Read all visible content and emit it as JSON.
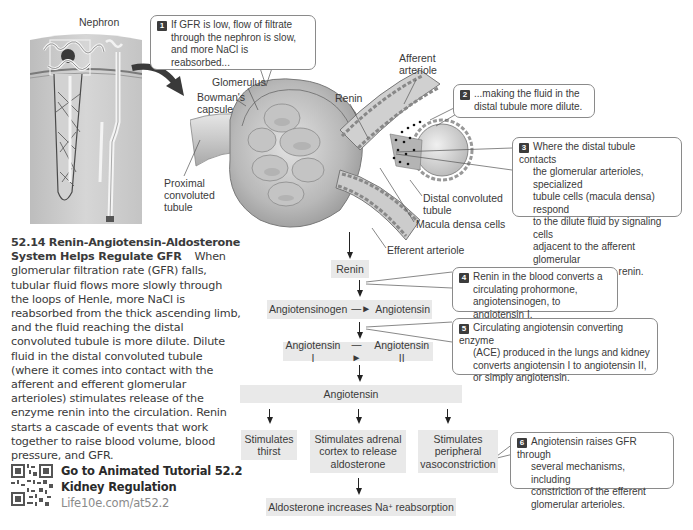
{
  "figure": {
    "nephron_label": "Nephron",
    "anatomy_labels": {
      "glomerulus": "Glomerulus",
      "bowmans_capsule_line1": "Bowman's",
      "bowmans_capsule_line2": "capsule",
      "proximal_line1": "Proximal",
      "proximal_line2": "convoluted",
      "proximal_line3": "tubule",
      "afferent_line1": "Afferent",
      "afferent_line2": "arteriole",
      "renin": "Renin",
      "distal_line1": "Distal convoluted",
      "distal_line2": "tubule",
      "macula_densa": "Macula densa cells",
      "efferent": "Efferent arteriole"
    },
    "callouts": [
      {
        "num": "1",
        "lines": [
          "If GFR is low, flow of filtrate",
          "through the nephron is slow,",
          "and more NaCl is reabsorbed..."
        ]
      },
      {
        "num": "2",
        "lines": [
          "...making the fluid in the",
          "distal tubule more dilute."
        ]
      },
      {
        "num": "3",
        "lines": [
          "Where the distal tubule contacts",
          "the glomerular arterioles, specialized",
          "tubule cells (macula densa) respond",
          "to the dilute fluid by signaling cells",
          "adjacent to the afferent glomerular",
          "arteriole to release renin."
        ]
      },
      {
        "num": "4",
        "lines": [
          "Renin in the blood converts a",
          "circulating prohormone,",
          "angiotensinogen, to angiotensin I."
        ]
      },
      {
        "num": "5",
        "lines": [
          "Circulating angiotensin converting enzyme",
          "(ACE) produced in the lungs and kidney",
          "converts angiotensin I to angiotensin II,",
          "or simply angiotensin."
        ]
      },
      {
        "num": "6",
        "lines": [
          "Angiotensin raises GFR through",
          "several mechanisms, including",
          "constriction of the efferent",
          "glomerular arterioles."
        ]
      }
    ],
    "flow": {
      "renin": "Renin",
      "step2_left": "Angiotensinogen",
      "step2_right": "Angiotensin",
      "step3_left": "Angiotensin I",
      "step3_right": "Angiotensin II",
      "angiotensin": "Angiotensin",
      "effects": [
        {
          "lines": [
            "Stimulates",
            "thirst"
          ]
        },
        {
          "lines": [
            "Stimulates adrenal",
            "cortex to release",
            "aldosterone"
          ]
        },
        {
          "lines": [
            "Stimulates",
            "peripheral",
            "vasoconstriction"
          ]
        }
      ],
      "aldosterone_prefix": "Aldosterone increases Na",
      "aldosterone_sup": "+",
      "aldosterone_suffix": " reabsorption"
    }
  },
  "caption": {
    "number": "52.14",
    "title": "Renin-Angiotensin-Aldosterone System Helps Regulate GFR",
    "body": "When glomerular filtration rate (GFR) falls, tubular fluid flows more slowly through the loops of Henle, more NaCl is reabsorbed from the thick ascending limb, and the fluid reaching the distal convoluted tubule is more dilute. Dilute fluid in the distal convoluted tubule (where it comes into contact with the afferent and efferent glomerular arterioles) stimulates release of the enzyme renin into the circulation. Renin starts a cascade of events that work together to raise blood volume, blood pressure, and GFR."
  },
  "tutorial": {
    "line1": "Go to Animated Tutorial 52.2",
    "line2": "Kidney Regulation",
    "link": "Life10e.com/at52.2"
  },
  "colors": {
    "box_bg": "#e9e9e9",
    "callout_border": "#8a8a8a",
    "number_badge": "#3c3c3c",
    "tissue": "#c9c9c9",
    "link_gray": "#8a8a8a"
  }
}
